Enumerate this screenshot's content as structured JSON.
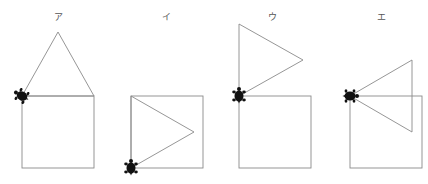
{
  "figure": {
    "panels": [
      {
        "label": "ア",
        "label_x": 58,
        "square": {
          "x": 22,
          "y": 96,
          "size": 72
        },
        "triangle": [
          [
            22,
            96
          ],
          [
            58,
            32
          ],
          [
            94,
            96
          ]
        ],
        "turtle": {
          "x": 22,
          "y": 96,
          "heading": -60
        }
      },
      {
        "label": "イ",
        "label_x": 166,
        "square": {
          "x": 131,
          "y": 96,
          "size": 72
        },
        "triangle": [
          [
            131,
            96
          ],
          [
            194,
            132
          ],
          [
            131,
            168
          ]
        ],
        "turtle": {
          "x": 131,
          "y": 168,
          "heading": 0
        }
      },
      {
        "label": "ウ",
        "label_x": 272,
        "square": {
          "x": 239,
          "y": 96,
          "size": 72
        },
        "triangle": [
          [
            239,
            24
          ],
          [
            303,
            60
          ],
          [
            239,
            96
          ]
        ],
        "turtle": {
          "x": 239,
          "y": 96,
          "heading": 0
        }
      },
      {
        "label": "エ",
        "label_x": 381,
        "square": {
          "x": 350,
          "y": 96,
          "size": 72
        },
        "triangle": [
          [
            350,
            96
          ],
          [
            412,
            60
          ],
          [
            412,
            132
          ]
        ],
        "turtle": {
          "x": 350,
          "y": 96,
          "heading": 90
        }
      }
    ],
    "colors": {
      "line": "#8a8a8a",
      "turtle": "#111111",
      "label": "#555555"
    }
  }
}
